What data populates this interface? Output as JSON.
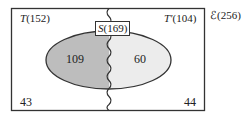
{
  "diagram": {
    "type": "venn",
    "universe": {
      "symbol": "ℰ",
      "count": "256",
      "label": "ℰ(256)"
    },
    "set_T": {
      "symbol": "T",
      "count": "152",
      "label_sym": "T",
      "label_count": "(152)"
    },
    "set_T_complement": {
      "symbol": "T'",
      "count": "104",
      "label_sym": "T'",
      "label_count": "(104)"
    },
    "set_S": {
      "symbol": "S",
      "count": "169",
      "label_sym": "S",
      "label_count": "(169)"
    },
    "regions": {
      "S_and_T": "109",
      "S_and_T_complement": "60",
      "T_not_S": "43",
      "T_complement_not_S": "44"
    },
    "colors": {
      "outline": "#333333",
      "S_and_T_fill": "#bdbdbd",
      "S_and_T_complement_fill": "#ececec",
      "background": "#ffffff"
    }
  }
}
